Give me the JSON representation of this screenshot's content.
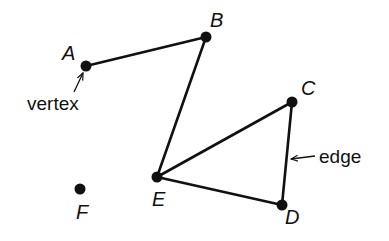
{
  "diagram": {
    "type": "graph",
    "vertices": [
      {
        "id": "A",
        "label": "A",
        "x": 86,
        "y": 66,
        "lx": 62,
        "ly": 60
      },
      {
        "id": "B",
        "label": "B",
        "x": 206,
        "y": 37,
        "lx": 210,
        "ly": 27
      },
      {
        "id": "C",
        "label": "C",
        "x": 292,
        "y": 102,
        "lx": 301,
        "ly": 95
      },
      {
        "id": "D",
        "label": "D",
        "x": 282,
        "y": 205,
        "lx": 285,
        "ly": 224
      },
      {
        "id": "E",
        "label": "E",
        "x": 157,
        "y": 177,
        "lx": 152,
        "ly": 206
      },
      {
        "id": "F",
        "label": "F",
        "x": 80,
        "y": 189,
        "lx": 76,
        "ly": 219
      }
    ],
    "edges": [
      {
        "from": "A",
        "to": "B"
      },
      {
        "from": "B",
        "to": "E"
      },
      {
        "from": "E",
        "to": "C"
      },
      {
        "from": "C",
        "to": "D"
      },
      {
        "from": "E",
        "to": "D"
      }
    ],
    "annotations": {
      "vertex": {
        "text": "vertex",
        "target": "A"
      },
      "edge": {
        "text": "edge",
        "target": "C-D"
      }
    }
  }
}
